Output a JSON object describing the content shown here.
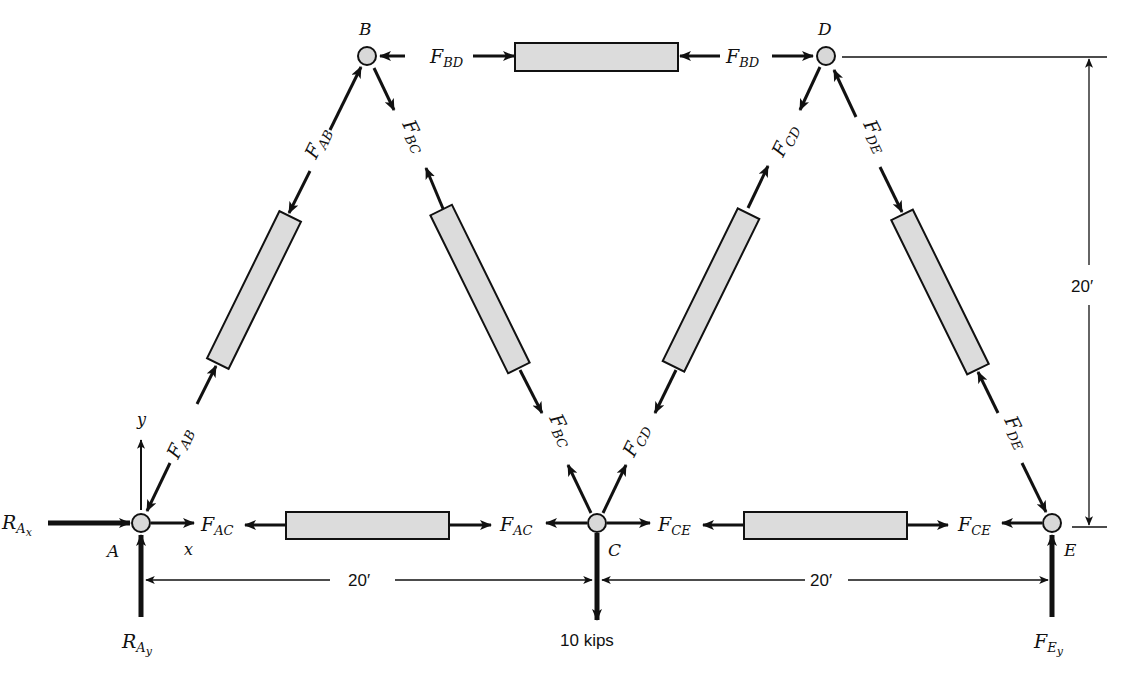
{
  "figure": {
    "type": "truss free-body diagram",
    "nodes": [
      {
        "id": "A",
        "label": "A",
        "x": 141,
        "y": 523
      },
      {
        "id": "B",
        "label": "B",
        "x": 367,
        "y": 56
      },
      {
        "id": "C",
        "label": "C",
        "x": 597,
        "y": 523
      },
      {
        "id": "D",
        "label": "D",
        "x": 826,
        "y": 56
      },
      {
        "id": "E",
        "label": "E",
        "x": 1052,
        "y": 523
      }
    ],
    "members": [
      {
        "id": "AB",
        "force_label": "F",
        "force_sub": "AB"
      },
      {
        "id": "BC",
        "force_label": "F",
        "force_sub": "BC"
      },
      {
        "id": "CD",
        "force_label": "F",
        "force_sub": "CD"
      },
      {
        "id": "DE",
        "force_label": "F",
        "force_sub": "DE"
      },
      {
        "id": "BD",
        "force_label": "F",
        "force_sub": "BD"
      },
      {
        "id": "AC",
        "force_label": "F",
        "force_sub": "AC"
      },
      {
        "id": "CE",
        "force_label": "F",
        "force_sub": "CE"
      }
    ],
    "reactions": {
      "RAx": {
        "main": "R",
        "sub": "A",
        "subsub": "x"
      },
      "RAy": {
        "main": "R",
        "sub": "A",
        "subsub": "y"
      },
      "FEy": {
        "main": "F",
        "sub": "E",
        "subsub": "y"
      }
    },
    "load": {
      "label": "10 kips",
      "node": "C",
      "direction": "down"
    },
    "axes": {
      "x_label": "x",
      "y_label": "y"
    },
    "dimensions": {
      "span_AC": "20′",
      "span_CE": "20′",
      "height": "20′"
    },
    "colors": {
      "bar_fill": "#dcdcdc",
      "node_fill": "#d8d8d8",
      "ink": "#111111"
    }
  }
}
